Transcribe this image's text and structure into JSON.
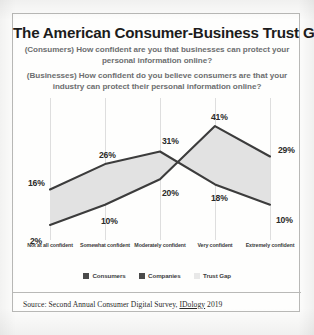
{
  "card": {
    "title": "The American Consumer-Business Trust Gap",
    "subtitle_consumers": "(Consumers) How confident are you that businesses can protect your personal information online?",
    "subtitle_businesses": "(Businesses) How confident do you believe consumers are that your industry can protect their personal information online?",
    "source": "Source: Second Annual Consumer Digital Survey, IDology 2019",
    "source_prefix": "Source: Second Annual Consumer Digital Survey, ",
    "source_brand": "IDology",
    "source_year": " 2019"
  },
  "colors": {
    "line": "#3c3c3c",
    "gap_fill": "#e2e2e2",
    "gridline": "#dedede",
    "border": "#b9b9b7",
    "title_text": "#1c1c1c",
    "subtitle_text": "#6d6e70",
    "legend_consumers": "#4a4a4a",
    "legend_companies": "#4a4a4a",
    "legend_trustgap": "#e8e8e8"
  },
  "chart_data": {
    "type": "line",
    "title": "The American Consumer-Business Trust Gap",
    "xlabel": "",
    "ylabel": "",
    "ylim": [
      0,
      45
    ],
    "grid": true,
    "legend_position": "bottom",
    "categories": [
      "Not at all confident",
      "Somewhat confident",
      "Moderately confident",
      "Very confident",
      "Extremely confident"
    ],
    "series": [
      {
        "name": "Consumers",
        "values": [
          16,
          26,
          31,
          18,
          10
        ],
        "labels": [
          "16%",
          "26%",
          "31%",
          "18%",
          "10%"
        ]
      },
      {
        "name": "Companies",
        "values": [
          2,
          10,
          20,
          41,
          29
        ],
        "labels": [
          "2%",
          "10%",
          "20%",
          "41%",
          "29%"
        ]
      }
    ],
    "shaded_region": {
      "name": "Trust Gap",
      "between": [
        "Consumers",
        "Companies"
      ]
    },
    "legend": [
      "Consumers",
      "Companies",
      "Trust Gap"
    ]
  }
}
